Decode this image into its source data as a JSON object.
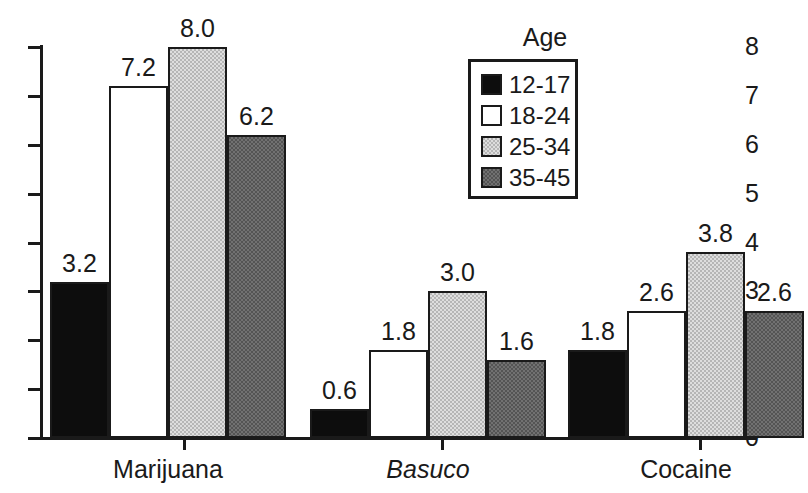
{
  "chart_data": {
    "type": "bar",
    "title": "",
    "xlabel": "",
    "ylabel": "",
    "ylim": [
      0,
      8
    ],
    "y_ticks": [
      "0",
      "1",
      "2",
      "3",
      "4",
      "5",
      "6",
      "7",
      "8"
    ],
    "grid": false,
    "legend_position": "top-right",
    "legend_title": "Age",
    "categories": [
      "Marijuana",
      "Basuco",
      "Cocaine"
    ],
    "categories_italic": [
      false,
      true,
      false
    ],
    "series": [
      {
        "name": "12-17",
        "swatch": "black",
        "color": "#0d0d0d",
        "values": [
          3.2,
          0.6,
          1.8
        ]
      },
      {
        "name": "18-24",
        "swatch": "white",
        "color": "#ffffff",
        "values": [
          7.2,
          1.8,
          2.6
        ]
      },
      {
        "name": "25-34",
        "swatch": "light-gray",
        "color": "#b6b6b6",
        "values": [
          8.0,
          3.0,
          3.8
        ]
      },
      {
        "name": "35-45",
        "swatch": "dark-gray",
        "color": "#545454",
        "values": [
          6.2,
          1.6,
          2.6
        ]
      }
    ],
    "data_labels": [
      [
        "3.2",
        "7.2",
        "8.0",
        "6.2"
      ],
      [
        "0.6",
        "1.8",
        "3.0",
        "1.6"
      ],
      [
        "1.8",
        "2.6",
        "3.8",
        "2.6"
      ]
    ]
  },
  "legend": {
    "title": "Age",
    "items": [
      {
        "label": "12-17",
        "swatch": "black"
      },
      {
        "label": "18-24",
        "swatch": "white"
      },
      {
        "label": "25-34",
        "swatch": "light-gray"
      },
      {
        "label": "35-45",
        "swatch": "dark-gray"
      }
    ]
  },
  "axis": {
    "y_ticks": [
      "0",
      "1",
      "2",
      "3",
      "4",
      "5",
      "6",
      "7",
      "8"
    ],
    "x_categories": [
      "Marijuana",
      "Basuco",
      "Cocaine"
    ]
  }
}
